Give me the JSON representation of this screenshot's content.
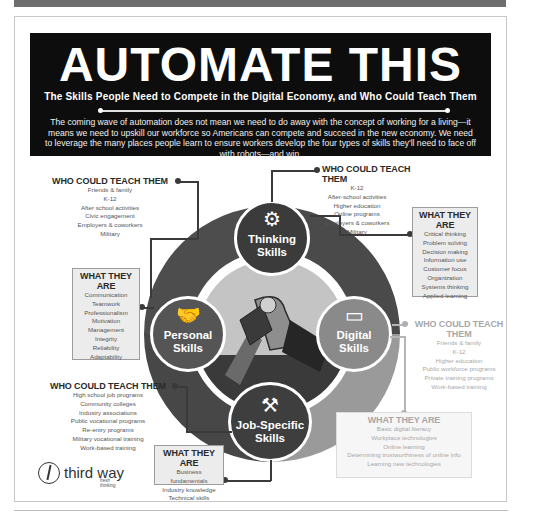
{
  "banner": {
    "title": "AUTOMATE THIS",
    "subtitle": "The Skills People Need to Compete in the Digital Economy, and Who Could Teach Them",
    "body": "The coming wave of automation does not mean we need to do away with the concept of working for a living—it means we need to upskill our workforce so Americans can compete and succeed in the new economy. We need to leverage the many places people learn to ensure workers develop the four types of skills they'll need to face off with robots—and win."
  },
  "colors": {
    "banner_bg": "#0d0d0d",
    "thinking": "#3b3b3b",
    "personal": "#555555",
    "digital": "#8a8a8a",
    "job_specific": "#3e3e3e",
    "ring_dark": "#4a4a4a",
    "ring_light": "#9a9a9a",
    "center": "#c4c4c4"
  },
  "skills": {
    "thinking": {
      "line1": "Thinking",
      "line2": "Skills",
      "icon": "head-gears-icon",
      "who_heading": "WHO COULD TEACH THEM",
      "who": [
        "K-12",
        "After-school activities",
        "Higher education",
        "Online programs",
        "Employers & coworkers",
        "Military"
      ],
      "what_heading": "WHAT THEY ARE",
      "what": [
        "Critical thinking",
        "Problem solving",
        "Decision making",
        "Information use",
        "Customer focus",
        "Organization",
        "Systems thinking",
        "Applied learning"
      ]
    },
    "personal": {
      "line1": "Personal",
      "line2": "Skills",
      "icon": "handshake-icon",
      "who_heading": "WHO COULD TEACH THEM",
      "who": [
        "Friends & family",
        "K-12",
        "After school activities",
        "Civic engagement",
        "Employers & coworkers",
        "Military"
      ],
      "what_heading": "WHAT THEY ARE",
      "what": [
        "Communication",
        "Teamwork",
        "Professionalism",
        "Motivation",
        "Management",
        "Integrity",
        "Reliability",
        "Adaptability"
      ]
    },
    "digital": {
      "line1": "Digital",
      "line2": "Skills",
      "icon": "devices-icon",
      "who_heading": "WHO COULD TEACH THEM",
      "who": [
        "Friends & family",
        "K-12",
        "Higher education",
        "Public workforce programs",
        "Private training programs",
        "Work-based training"
      ],
      "what_heading": "WHAT THEY ARE",
      "what": [
        "Basic digital literacy",
        "Workplace technologies",
        "Online learning",
        "Determining trustworthiness of online info",
        "Learning new technologies"
      ]
    },
    "job_specific": {
      "line1": "Job-Specific",
      "line2": "Skills",
      "icon": "hammer-wrench-icon",
      "who_heading": "WHO COULD TEACH THEM",
      "who": [
        "High school job programs",
        "Community colleges",
        "Industry associations",
        "Public vocational programs",
        "Re-entry programs",
        "Military vocational training",
        "Work-based training"
      ],
      "what_heading": "WHAT THEY ARE",
      "what": [
        "Business fundamentals",
        "Industry knowledge",
        "Technical skills"
      ]
    }
  },
  "logo": {
    "name": "third way",
    "tagline": "fresh thinking"
  }
}
